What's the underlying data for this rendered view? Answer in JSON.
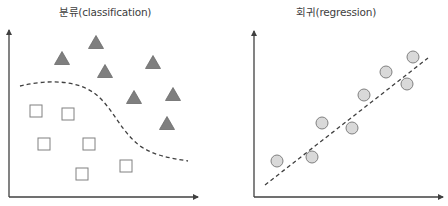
{
  "colors": {
    "axis": "#404040",
    "triangle_fill": "#7f7f7f",
    "triangle_stroke": "#6a6a6a",
    "square_fill": "#ffffff",
    "square_stroke": "#808080",
    "circle_fill": "#d9d9d9",
    "circle_stroke": "#808080",
    "dash": "#404040",
    "title": "#404040"
  },
  "classification": {
    "title": "분류(classification)",
    "title_x": 105,
    "axes": {
      "origin": [
        9,
        197
      ],
      "y_top": 30,
      "x_right": 198
    },
    "triangles": [
      [
        62,
        58
      ],
      [
        96,
        42
      ],
      [
        105,
        71
      ],
      [
        153,
        62
      ],
      [
        134,
        97
      ],
      [
        173,
        94
      ],
      [
        167,
        123
      ]
    ],
    "squares": [
      [
        36,
        111
      ],
      [
        68,
        114
      ],
      [
        44,
        144
      ],
      [
        89,
        144
      ],
      [
        82,
        174
      ],
      [
        126,
        166
      ]
    ],
    "boundary_path": "M 20 86 C 45 80, 80 78, 100 98 C 115 113, 122 132, 140 146 C 155 156, 170 158, 188 161"
  },
  "regression": {
    "title": "회귀(regression)",
    "title_x": 336,
    "axes": {
      "origin": [
        254,
        197
      ],
      "y_top": 31,
      "x_right": 443
    },
    "points": [
      [
        277,
        161
      ],
      [
        312,
        157
      ],
      [
        322,
        123
      ],
      [
        352,
        128
      ],
      [
        364,
        95
      ],
      [
        386,
        72
      ],
      [
        407,
        84
      ],
      [
        413,
        57
      ]
    ],
    "fit_line": {
      "from": [
        265,
        185
      ],
      "to": [
        428,
        58
      ]
    }
  }
}
